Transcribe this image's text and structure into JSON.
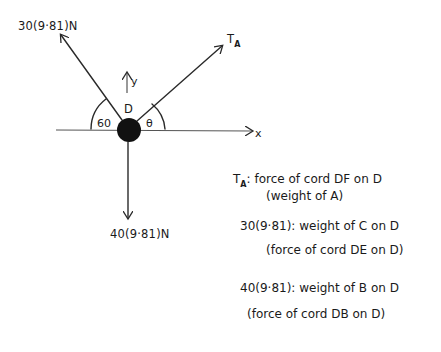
{
  "diagram": {
    "node": {
      "label": "D",
      "color": "#111111"
    },
    "axes": {
      "x_label": "x",
      "y_label": "y"
    },
    "forces": {
      "left_upper": {
        "label": "30(9·81)N",
        "angle_label": "60"
      },
      "right_upper": {
        "label_main": "T",
        "label_sub": "A",
        "angle_label": "θ"
      },
      "down": {
        "label": "40(9·81)N"
      }
    },
    "notes": [
      {
        "symbol_main": "T",
        "symbol_sub": "A",
        "line1": ": force of cord DF on D",
        "line2": "(weight of A)"
      },
      {
        "line1": "30(9·81): weight of C on D",
        "line2": "(force of cord DE on D)"
      },
      {
        "line1": "40(9·81): weight of B on D",
        "line2": "(force of cord DB on D)"
      }
    ]
  }
}
